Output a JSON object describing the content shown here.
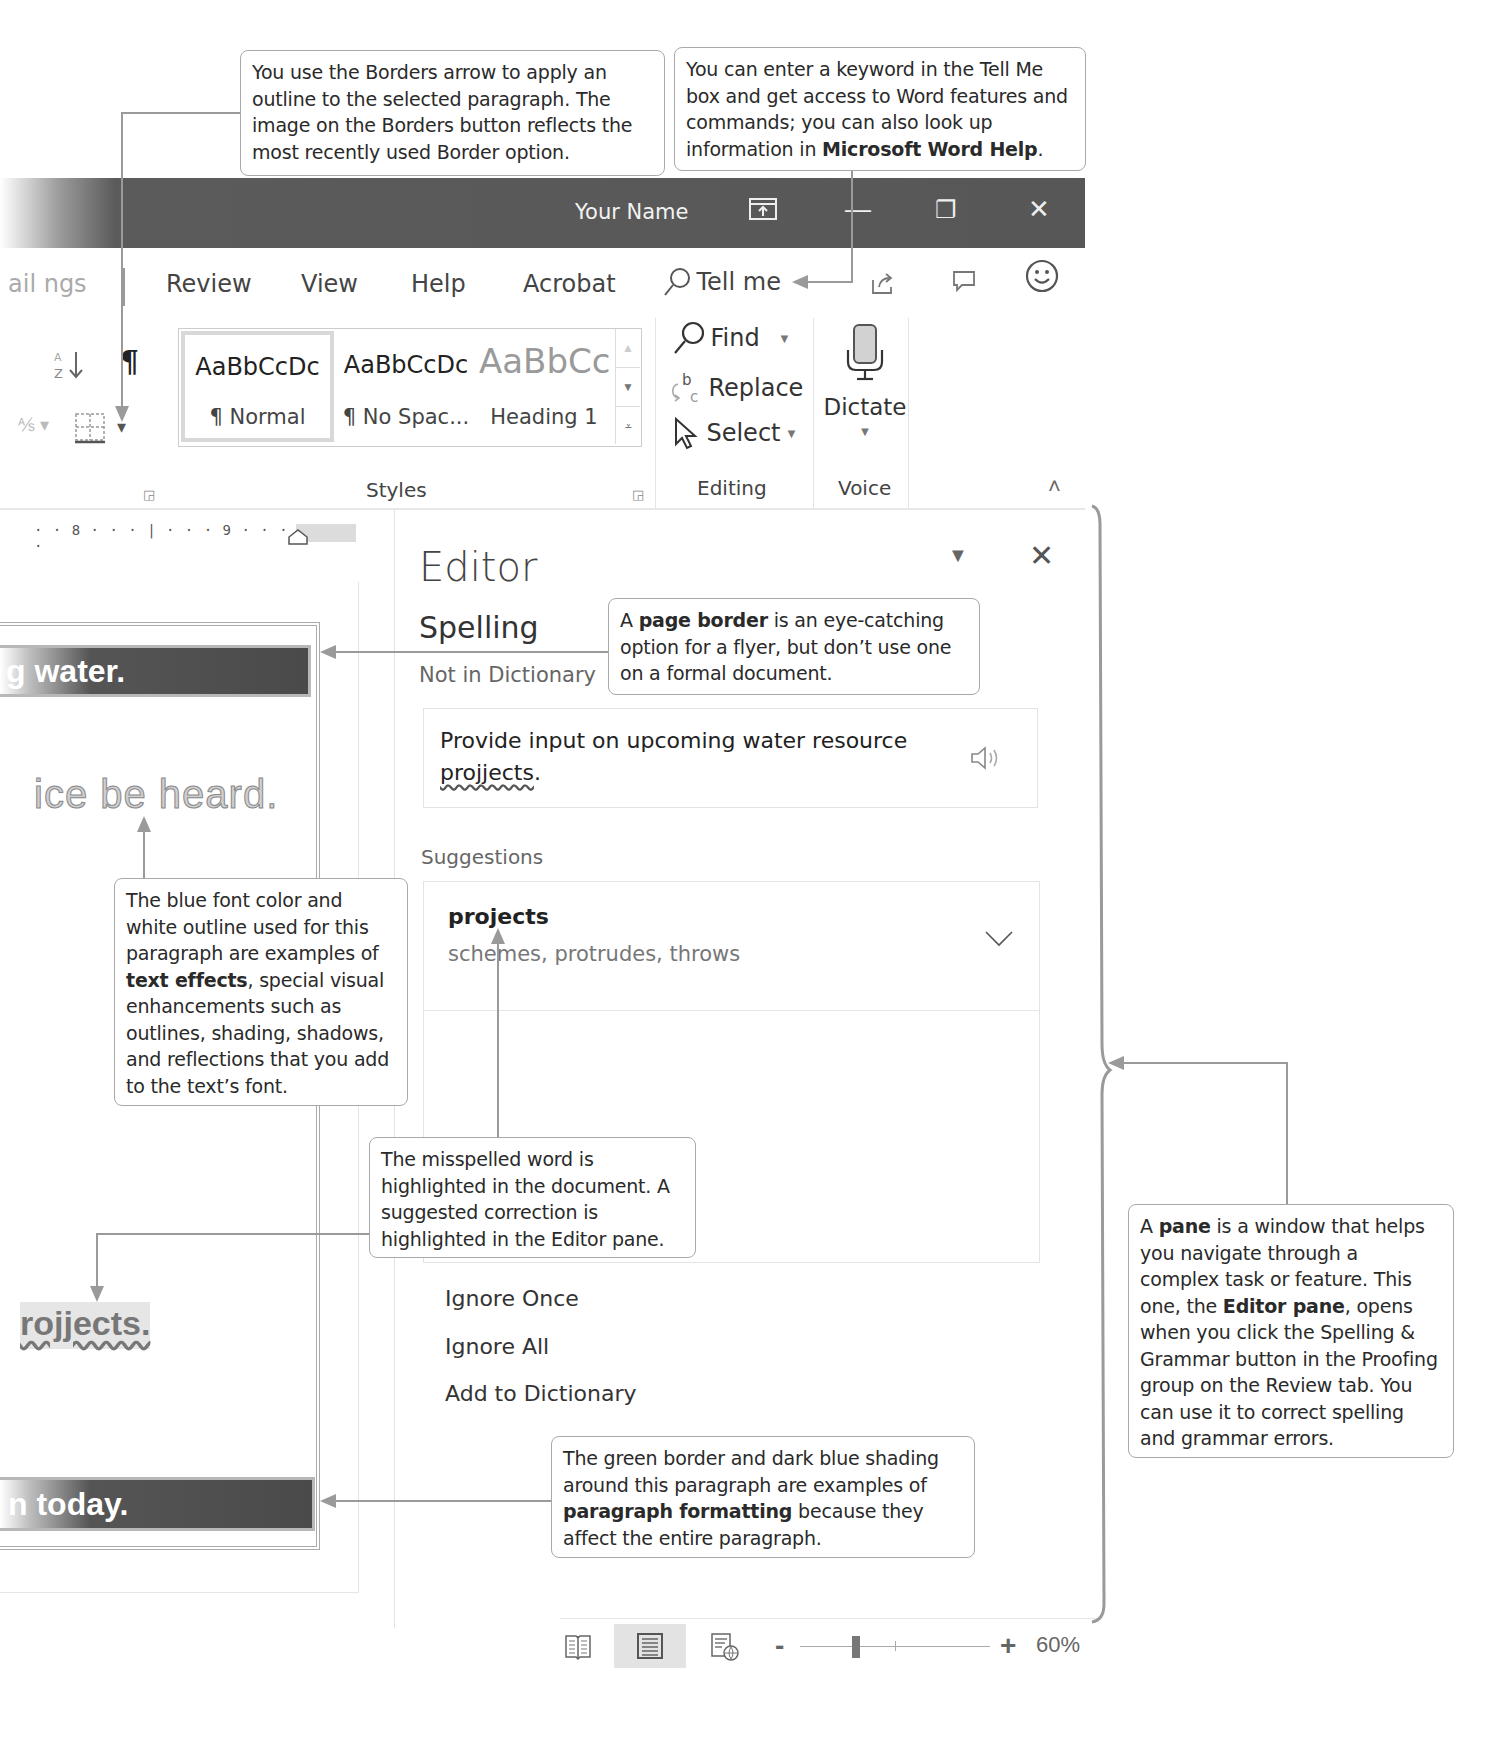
{
  "window": {
    "title": "Your Name",
    "controls": {
      "ribbon_display": "ribbon-display-options-icon",
      "minimize": "—",
      "restore": "❐",
      "close": "✕"
    }
  },
  "tabs": [
    {
      "label": "Mailings",
      "partial": "ail ngs"
    },
    {
      "label": "Review"
    },
    {
      "label": "View"
    },
    {
      "label": "Help"
    },
    {
      "label": "Acrobat"
    }
  ],
  "tell_me": {
    "placeholder": "Tell me"
  },
  "ribbon_right_icons": [
    "share-icon",
    "comments-icon",
    "feedback-smiley-icon"
  ],
  "paragraph_group": {
    "show_marks": "¶",
    "sort": "A↓Z",
    "borders_dropdown": "▾"
  },
  "styles_group": {
    "label": "Styles",
    "items": [
      {
        "sample": "AaBbCcDc",
        "name": "¶ Normal",
        "selected": true
      },
      {
        "sample": "AaBbCcDc",
        "name": "¶ No Spac..."
      },
      {
        "sample": "AaBbCc",
        "name": "Heading 1"
      }
    ]
  },
  "editing_group": {
    "label": "Editing",
    "find": "Find",
    "replace": "Replace",
    "select": "Select"
  },
  "voice_group": {
    "label": "Voice",
    "dictate": "Dictate"
  },
  "ruler": {
    "marks": "· · 8 · · · | · · · 9 · · · | · · ·"
  },
  "document": {
    "line1": "g water.",
    "line2": "ice be heard.",
    "line3": "rojjects.",
    "line4": "n today."
  },
  "editor_pane": {
    "title": "Editor",
    "section": "Spelling",
    "issue_type": "Not in Dictionary",
    "context_sentence": "Provide input on upcoming water resource",
    "context_word": "projjects",
    "context_end": ".",
    "suggestions_label": "Suggestions",
    "top_suggestion": "projects",
    "synonyms": "schemes, protrudes, throws",
    "actions": [
      "Ignore Once",
      "Ignore All",
      "Add to Dictionary"
    ]
  },
  "status_bar": {
    "views": [
      "read-mode-icon",
      "print-layout-icon",
      "web-layout-icon"
    ],
    "zoom_minus": "-",
    "zoom_plus": "+",
    "zoom_level": "60%"
  },
  "callouts": {
    "borders": "You use the Borders arrow to apply an outline to the selected paragraph. The image on the Borders button reflects the most recently used Border option.",
    "tellme_pre": "You can enter a keyword in the Tell Me box and get access to Word features and commands; you can also look up information in ",
    "tellme_bold": "Microsoft Word Help",
    "tellme_post": ".",
    "pageborder_pre": "A ",
    "pageborder_bold": "page border",
    "pageborder_post": " is an eye-catching option for a flyer, but don’t use one on a formal document.",
    "texteffects_pre": "The blue font color and white outline used for this paragraph are examples of ",
    "texteffects_bold": "text effects",
    "texteffects_post": ", special visual enhancements such as outlines, shading, shadows, and reflections that you add to the text’s font.",
    "misspelled": "The misspelled word is highlighted in the document. A suggested correction is highlighted in the Editor pane.",
    "paraformat_pre": "The green border and dark blue shading around this paragraph are examples of ",
    "paraformat_bold": "paragraph formatting",
    "paraformat_post": " because they affect the entire paragraph.",
    "pane_pre": "A ",
    "pane_bold1": "pane",
    "pane_mid1": " is a window that helps you navigate through a complex task or feature. This one, the ",
    "pane_bold2": "Editor pane",
    "pane_post": ", opens when you click the Spelling & Grammar button in the Proofing group on the Review tab. You can use it to correct spelling and grammar errors."
  },
  "colors": {
    "title_bar": "#575757",
    "callout_border": "#a9a9a9",
    "leader_line": "#9a9a9a",
    "shaded_paragraph": "#4a4a4a"
  }
}
